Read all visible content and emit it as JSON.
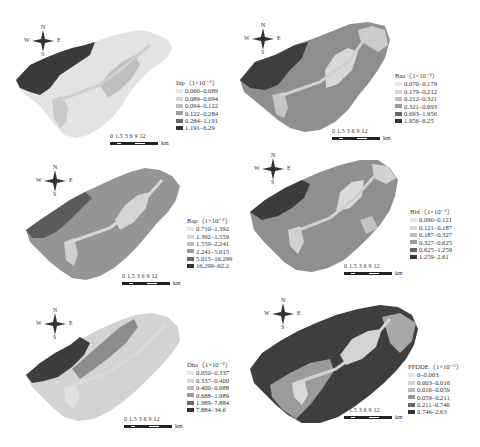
{
  "figure": {
    "caption": ""
  },
  "compass": {
    "n": "N",
    "s": "S",
    "w": "W",
    "e": "E"
  },
  "scale_bar": {
    "ticks": "0 1.5 3  6    9  12",
    "unit": "km"
  },
  "panels": [
    {
      "id": "inp",
      "legend_title": "Inp（1×10⁻⁶）",
      "classes": [
        {
          "range": "0.060–0.089",
          "color": "#e6e6e6"
        },
        {
          "range": "0.089–0.094",
          "color": "#d6d6d6"
        },
        {
          "range": "0.094–0.122",
          "color": "#bdbdbd"
        },
        {
          "range": "0.122–0.284",
          "color": "#9a9a9a"
        },
        {
          "range": "0.284–1.191",
          "color": "#666666"
        },
        {
          "range": "1.191–6.29",
          "color": "#333333"
        }
      ]
    },
    {
      "id": "baa",
      "legend_title": "Baa（1×10⁻⁶）",
      "classes": [
        {
          "range": "0.070–0.179",
          "color": "#e6e6e6"
        },
        {
          "range": "0.179–0.212",
          "color": "#d6d6d6"
        },
        {
          "range": "0.212–0.321",
          "color": "#bdbdbd"
        },
        {
          "range": "0.321–0.693",
          "color": "#9a9a9a"
        },
        {
          "range": "0.693–1.956",
          "color": "#666666"
        },
        {
          "range": "1.956–6.25",
          "color": "#333333"
        }
      ]
    },
    {
      "id": "bap",
      "legend_title": "Bap（1×10⁻⁶）",
      "classes": [
        {
          "range": "0.710–1.392",
          "color": "#e6e6e6"
        },
        {
          "range": "1.392–1.559",
          "color": "#d6d6d6"
        },
        {
          "range": "1.559–2.241",
          "color": "#bdbdbd"
        },
        {
          "range": "2.241–5.015",
          "color": "#9a9a9a"
        },
        {
          "range": "5.015–16.299",
          "color": "#666666"
        },
        {
          "range": "16.299–62.2",
          "color": "#333333"
        }
      ]
    },
    {
      "id": "bbf",
      "legend_title": "Bbf（1×10⁻⁶）",
      "classes": [
        {
          "range": "0.090–0.121",
          "color": "#e6e6e6"
        },
        {
          "range": "0.121–0.187",
          "color": "#d6d6d6"
        },
        {
          "range": "0.187–0.327",
          "color": "#bdbdbd"
        },
        {
          "range": "0.327–0.625",
          "color": "#9a9a9a"
        },
        {
          "range": "0.625–1.259",
          "color": "#666666"
        },
        {
          "range": "1.259–2.61",
          "color": "#333333"
        }
      ]
    },
    {
      "id": "dha",
      "legend_title": "Dha（1×10⁻⁶）",
      "classes": [
        {
          "range": "0.050–0.337",
          "color": "#e6e6e6"
        },
        {
          "range": "0.337–0.400",
          "color": "#d6d6d6"
        },
        {
          "range": "0.400–0.688",
          "color": "#bdbdbd"
        },
        {
          "range": "0.688–1.989",
          "color": "#9a9a9a"
        },
        {
          "range": "1.989–7.884",
          "color": "#666666"
        },
        {
          "range": "7.884–34.6",
          "color": "#333333"
        }
      ]
    },
    {
      "id": "ppdde",
      "legend_title": "PPDDE（1×10⁻⁶）",
      "classes": [
        {
          "range": "0–0.003",
          "color": "#e6e6e6"
        },
        {
          "range": "0.003–0.016",
          "color": "#d6d6d6"
        },
        {
          "range": "0.016–0.059",
          "color": "#bdbdbd"
        },
        {
          "range": "0.059–0.211",
          "color": "#9a9a9a"
        },
        {
          "range": "0.211–0.746",
          "color": "#666666"
        },
        {
          "range": "0.746–2.63",
          "color": "#333333"
        }
      ]
    }
  ]
}
